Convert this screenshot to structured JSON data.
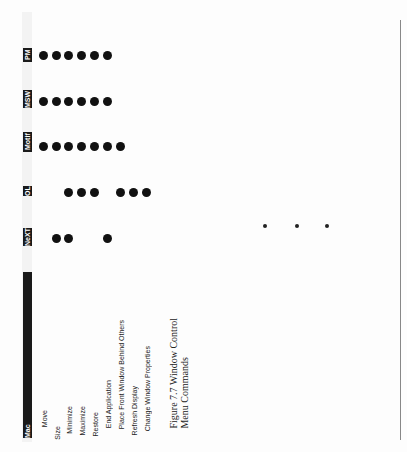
{
  "figure": {
    "caption_line1": "Figure 7.7 Window Control",
    "caption_line2": "Menu Commands"
  },
  "table": {
    "columns": [
      {
        "label": "PM",
        "y": 48
      },
      {
        "label": "MSW",
        "y": 92
      },
      {
        "label": "Motif",
        "y": 136
      },
      {
        "label": "OL",
        "y": 184
      },
      {
        "label": "NeXT",
        "y": 228
      },
      {
        "label": "Mac",
        "y": 275
      }
    ],
    "rows": [
      {
        "label": "Move",
        "x": 40
      },
      {
        "label": "Size",
        "x": 53
      },
      {
        "label": "Minimize",
        "x": 65
      },
      {
        "label": "Maximize",
        "x": 78
      },
      {
        "label": "Restore",
        "x": 91
      },
      {
        "label": "End Application",
        "x": 104
      },
      {
        "label": "Place Front Window Behind Others",
        "x": 117
      },
      {
        "label": "Refresh Display",
        "x": 130
      },
      {
        "label": "Change Window Properties",
        "x": 143
      }
    ],
    "support": {
      "PM": [
        "Move",
        "Size",
        "Minimize",
        "Maximize",
        "Restore",
        "End Application"
      ],
      "MSW": [
        "Move",
        "Size",
        "Minimize",
        "Maximize",
        "Restore",
        "End Application"
      ],
      "Motif": [
        "Move",
        "Size",
        "Minimize",
        "Maximize",
        "Restore",
        "End Application",
        "Place Front Window Behind Others"
      ],
      "OL": [
        "Minimize",
        "Maximize",
        "Restore",
        "Place Front Window Behind Others",
        "Refresh Display",
        "Change Window Properties"
      ],
      "NeXT": [
        "Size",
        "Minimize",
        "End Application"
      ],
      "Mac": []
    }
  },
  "decorations": {
    "stray_dots": [
      {
        "x": 263,
        "y": 225
      },
      {
        "x": 295,
        "y": 225
      },
      {
        "x": 325,
        "y": 225
      }
    ]
  }
}
